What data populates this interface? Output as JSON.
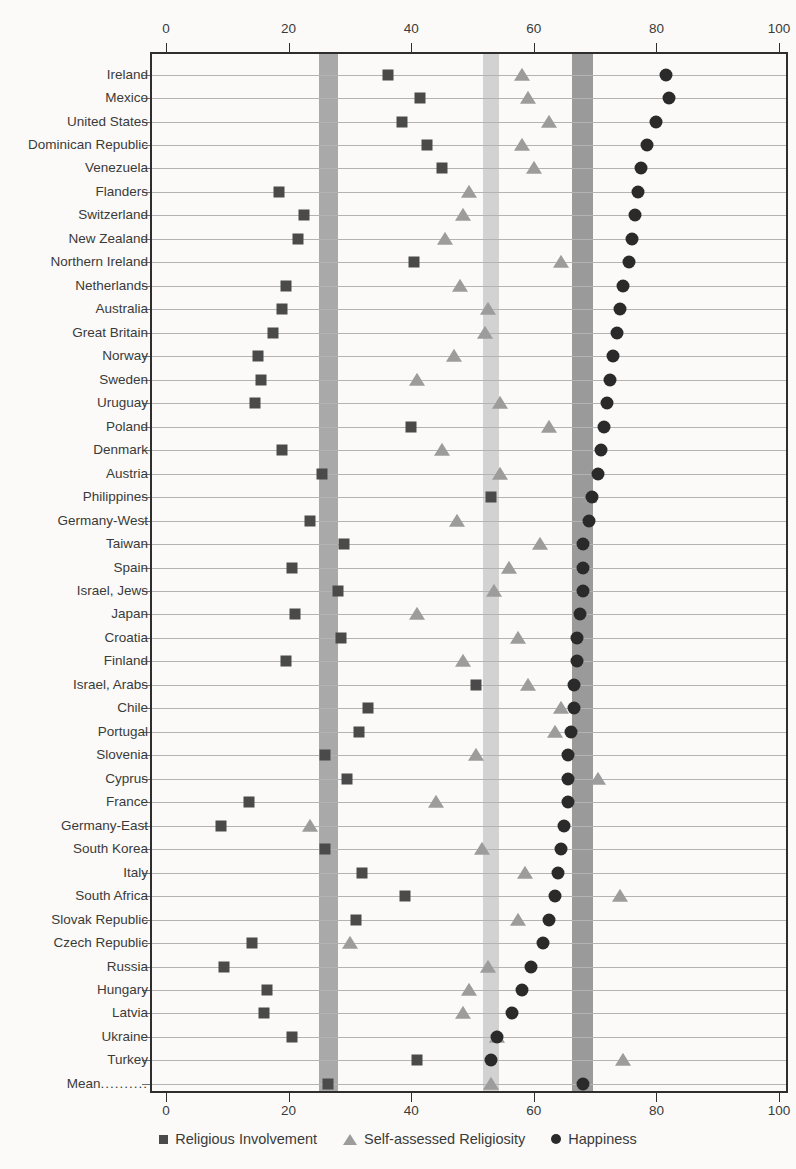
{
  "chart_data": {
    "type": "scatter",
    "title": "",
    "xlabel": "",
    "ylabel": "",
    "xlim": [
      0,
      100
    ],
    "xticks": [
      0,
      20,
      40,
      60,
      80,
      100
    ],
    "grid": true,
    "grid_axis": "y",
    "legend_position": "bottom",
    "orientation": "horizontal",
    "categories": [
      "Ireland",
      "Mexico",
      "United States",
      "Dominican Republic",
      "Venezuela",
      "Flanders",
      "Switzerland",
      "New Zealand",
      "Northern Ireland",
      "Netherlands",
      "Australia",
      "Great Britain",
      "Norway",
      "Sweden",
      "Uruguay",
      "Poland",
      "Denmark",
      "Austria",
      "Philippines",
      "Germany-West",
      "Taiwan",
      "Spain",
      "Israel, Jews",
      "Japan",
      "Croatia",
      "Finland",
      "Israel, Arabs",
      "Chile",
      "Portugal",
      "Slovenia",
      "Cyprus",
      "France",
      "Germany-East",
      "South Korea",
      "Italy",
      "South Africa",
      "Slovak Republic",
      "Czech Republic",
      "Russia",
      "Hungary",
      "Latvia",
      "Ukraine",
      "Turkey",
      "Mean"
    ],
    "mean_row_label": "Mean",
    "mean_row_leader": "..........",
    "series": [
      {
        "name": "Religious Involvement",
        "marker": "square",
        "color": "#4a4a4a",
        "values": [
          36.2,
          41.5,
          38.5,
          42.5,
          45.0,
          18.5,
          22.5,
          21.5,
          40.5,
          19.5,
          19.0,
          17.5,
          15.0,
          15.5,
          14.5,
          40.0,
          19.0,
          25.5,
          53.0,
          23.5,
          29.0,
          20.5,
          28.0,
          21.0,
          28.5,
          19.5,
          50.5,
          33.0,
          31.5,
          26.0,
          29.5,
          13.5,
          9.0,
          26.0,
          32.0,
          39.0,
          31.0,
          14.0,
          9.5,
          16.5,
          16.0,
          20.5,
          41.0,
          26.5
        ]
      },
      {
        "name": "Self-assessed Religiosity",
        "marker": "triangle",
        "color": "#9c9c9c",
        "values": [
          58.0,
          59.0,
          62.5,
          58.0,
          60.0,
          49.5,
          48.5,
          45.5,
          64.5,
          48.0,
          52.5,
          52.0,
          47.0,
          41.0,
          54.5,
          62.5,
          45.0,
          54.5,
          69.0,
          47.5,
          61.0,
          56.0,
          53.5,
          41.0,
          57.5,
          48.5,
          59.0,
          64.5,
          63.5,
          50.5,
          70.5,
          44.0,
          23.5,
          51.5,
          58.5,
          74.0,
          57.5,
          30.0,
          52.5,
          49.5,
          48.5,
          54.0,
          74.5,
          53.0
        ]
      },
      {
        "name": "Happiness",
        "marker": "circle",
        "color": "#2a2a2a",
        "values": [
          81.5,
          82.0,
          80.0,
          78.5,
          77.5,
          77.0,
          76.5,
          76.0,
          75.5,
          74.5,
          74.0,
          73.5,
          73.0,
          72.5,
          72.0,
          71.5,
          71.0,
          70.5,
          69.5,
          69.0,
          68.0,
          68.0,
          68.0,
          67.5,
          67.0,
          67.0,
          66.5,
          66.5,
          66.0,
          65.5,
          65.5,
          65.5,
          65.0,
          64.5,
          64.0,
          63.5,
          62.5,
          61.5,
          59.5,
          58.0,
          56.5,
          54.0,
          53.0,
          68.0
        ]
      }
    ],
    "reference_bands": [
      {
        "name": "religious-involvement-mean-band",
        "value": 26.5,
        "half_width": 1.6,
        "color": "#a9a9a9"
      },
      {
        "name": "self-assessed-religiosity-mean-band",
        "value": 53.0,
        "half_width": 1.3,
        "color": "#d2d2d2"
      },
      {
        "name": "happiness-mean-band",
        "value": 68.0,
        "half_width": 1.7,
        "color": "#9a9a9a"
      }
    ]
  },
  "legend": {
    "items": [
      {
        "label": "Religious Involvement",
        "marker": "square"
      },
      {
        "label": "Self-assessed Religiosity",
        "marker": "triangle"
      },
      {
        "label": "Happiness",
        "marker": "circle"
      }
    ]
  }
}
